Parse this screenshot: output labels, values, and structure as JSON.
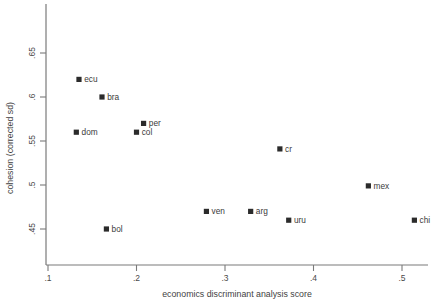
{
  "chart_data": {
    "type": "scatter",
    "title": "",
    "xlabel": "economics discriminant analysis score",
    "ylabel": "cohesion (corrected sd)",
    "xlim": [
      0.1,
      0.53
    ],
    "ylim": [
      0.425,
      0.675
    ],
    "grid": false,
    "legend": "none",
    "xticks": [
      ".1",
      ".2",
      ".3",
      ".4",
      ".5"
    ],
    "xtick_values": [
      0.1,
      0.2,
      0.3,
      0.4,
      0.5
    ],
    "yticks": [
      ".65",
      ".6",
      ".55",
      ".5",
      ".45"
    ],
    "ytick_values": [
      0.65,
      0.6,
      0.55,
      0.5,
      0.45
    ],
    "points": [
      {
        "label": "ecu",
        "x": 0.135,
        "y": 0.62,
        "label_pos": "right"
      },
      {
        "label": "bra",
        "x": 0.161,
        "y": 0.6,
        "label_pos": "right"
      },
      {
        "label": "dom",
        "x": 0.132,
        "y": 0.56,
        "label_pos": "right"
      },
      {
        "label": "per",
        "x": 0.208,
        "y": 0.57,
        "label_pos": "right"
      },
      {
        "label": "col",
        "x": 0.2,
        "y": 0.56,
        "label_pos": "right"
      },
      {
        "label": "cr",
        "x": 0.362,
        "y": 0.541,
        "label_pos": "right"
      },
      {
        "label": "mex",
        "x": 0.462,
        "y": 0.499,
        "label_pos": "right"
      },
      {
        "label": "ven",
        "x": 0.279,
        "y": 0.47,
        "label_pos": "right"
      },
      {
        "label": "arg",
        "x": 0.329,
        "y": 0.47,
        "label_pos": "right"
      },
      {
        "label": "uru",
        "x": 0.372,
        "y": 0.46,
        "label_pos": "right"
      },
      {
        "label": "bol",
        "x": 0.166,
        "y": 0.45,
        "label_pos": "right"
      },
      {
        "label": "chi",
        "x": 0.514,
        "y": 0.46,
        "label_pos": "right"
      }
    ]
  },
  "style": {
    "marker_color": "#2b2b2b",
    "axis_color": "#7a7a7a",
    "text_color": "#3a3a3a",
    "background": "#ffffff"
  }
}
